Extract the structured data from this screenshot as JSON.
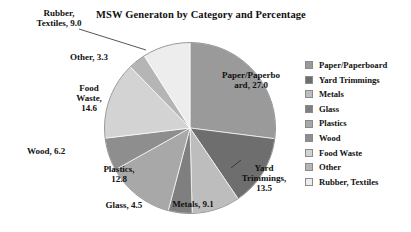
{
  "chart_data": {
    "type": "pie",
    "title": "MSW Generaton by Category and Percentage",
    "xlabel": "",
    "ylabel": "",
    "grid": false,
    "legend_position": "right",
    "units": "percent",
    "total": 100.0,
    "start_angle_deg": 0,
    "direction": "clockwise",
    "categories": [
      "Paper/Paperboard",
      "Yard Trimmings",
      "Metals",
      "Glass",
      "Plastics",
      "Wood",
      "Food Waste",
      "Other",
      "Rubber, Textiles"
    ],
    "values": [
      27.0,
      13.5,
      9.1,
      4.5,
      12.8,
      6.2,
      14.6,
      3.3,
      9.0
    ],
    "colors": [
      "#9a9a9a",
      "#6e6e6e",
      "#bdbdbd",
      "#7f7f7f",
      "#a8a8a8",
      "#8e8e8e",
      "#d3d3d3",
      "#b5b5b5",
      "#ededed"
    ],
    "data_labels": [
      "Paper/Paperbo\nard, 27.0",
      "Yard\nTrimmings,\n13.5",
      "Metals, 9.1",
      "Glass, 4.5",
      "Plastics,\n12.8",
      "Wood, 6.2",
      "Food\nWaste,\n14.6",
      "Other, 3.3",
      "Rubber,\nTextiles, 9.0"
    ]
  },
  "legend": {
    "items": [
      {
        "label": "Paper/Paperboard",
        "color": "#9a9a9a"
      },
      {
        "label": "Yard Trimmings",
        "color": "#6e6e6e"
      },
      {
        "label": "Metals",
        "color": "#bdbdbd"
      },
      {
        "label": "Glass",
        "color": "#7f7f7f"
      },
      {
        "label": "Plastics",
        "color": "#a8a8a8"
      },
      {
        "label": "Wood",
        "color": "#8e8e8e"
      },
      {
        "label": "Food Waste",
        "color": "#d3d3d3"
      },
      {
        "label": "Other",
        "color": "#b5b5b5"
      },
      {
        "label": "Rubber, Textiles",
        "color": "#ededed"
      }
    ]
  }
}
